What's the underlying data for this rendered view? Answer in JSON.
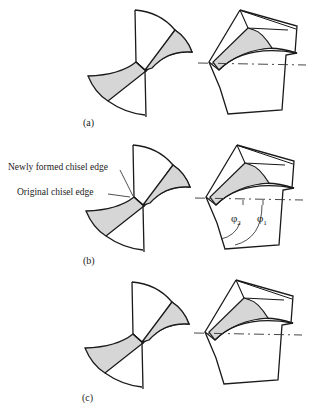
{
  "panels": [
    {
      "id": "a",
      "label": "(a)"
    },
    {
      "id": "b",
      "label": "(b)",
      "annotations": {
        "new_edge": "Newly formed chisel edge",
        "orig_edge": "Original chisel edge",
        "phi2": "φ",
        "phi2_sub": "2",
        "phi1": "φ",
        "phi1_sub": "1"
      }
    },
    {
      "id": "c",
      "label": "(c)"
    }
  ],
  "colors": {
    "stroke": "#1a1a1a",
    "fill_shade": "#d6d6d6",
    "background": "#ffffff"
  }
}
